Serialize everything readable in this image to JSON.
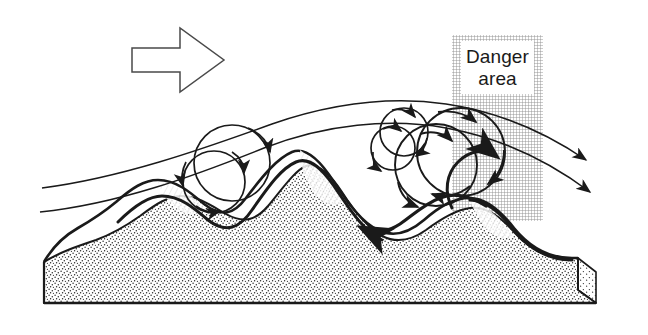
{
  "figure": {
    "background_color": "#ffffff",
    "ink_color": "#1a1a1a",
    "width": 648,
    "height": 335
  },
  "annotations": {
    "danger_area": {
      "line1": "Danger",
      "line2": "area",
      "hatch_color": "#8c8c8c",
      "box_fill": "#ffffff",
      "column_x": 452,
      "column_y": 35,
      "column_width": 91,
      "column_height": 186
    },
    "wind_arrow": {
      "name": "wind-direction-arrow",
      "direction": "right",
      "style": "hollow-outline",
      "x": 132,
      "y": 28,
      "width": 92,
      "height": 64
    }
  },
  "terrain": {
    "name": "terrain-block",
    "fill": "#ffffff",
    "stipple_color": "#262626",
    "description": "Stippled three-dimensional ground block with three ridges",
    "ridges": [
      {
        "name": "upwind-small-hill",
        "crest_x": 112,
        "crest_y": 232
      },
      {
        "name": "main-ridge",
        "crest_x": 300,
        "crest_y": 168
      },
      {
        "name": "downwind-hill",
        "crest_x": 492,
        "crest_y": 225
      }
    ]
  },
  "flow": {
    "streamlines": [
      {
        "name": "upper-streamline",
        "weight": "thin",
        "has_arrowhead": true
      },
      {
        "name": "lower-streamline",
        "weight": "thin",
        "has_arrowhead": true
      },
      {
        "name": "surface-flow-line",
        "weight": "thick",
        "has_arrowhead": true
      },
      {
        "name": "lee-reverse-flow",
        "weight": "thick",
        "has_arrowhead": true,
        "direction": "upstream"
      }
    ],
    "rotors": [
      {
        "name": "rotor-upwind-outer",
        "cx": 232,
        "cy": 163,
        "r": 38,
        "rotation": "clockwise"
      },
      {
        "name": "rotor-upwind-inner",
        "cx": 214,
        "cy": 182,
        "r": 31,
        "rotation": "clockwise"
      },
      {
        "name": "rotor-lee-small-upper",
        "cx": 404,
        "cy": 132,
        "r": 24,
        "rotation": "clockwise"
      },
      {
        "name": "rotor-lee-small-lower",
        "cx": 393,
        "cy": 148,
        "r": 22,
        "rotation": "clockwise"
      },
      {
        "name": "rotor-lee-large-outer",
        "cx": 461,
        "cy": 152,
        "r": 44,
        "rotation": "clockwise"
      },
      {
        "name": "rotor-lee-large-inner",
        "cx": 436,
        "cy": 165,
        "r": 41,
        "rotation": "clockwise"
      }
    ]
  }
}
